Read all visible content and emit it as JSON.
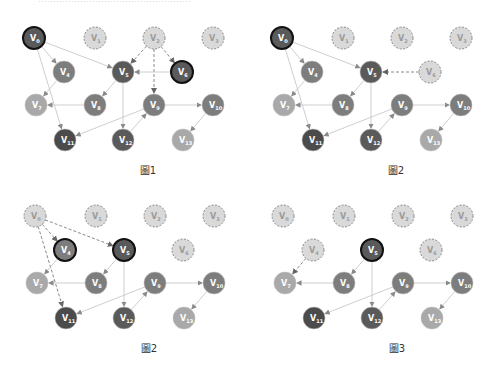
{
  "header": {
    "clipped_text": "……………………………………………"
  },
  "colors": {
    "dark": "#4b4b4b",
    "darker": "#5a5a5a",
    "medium": "#7d7d7d",
    "light": "#a9a9a9",
    "removed_fill": "#d9d9d9",
    "removed_stroke": "#8a8a8a",
    "edge": "#c8c8c8",
    "dashed_edge": "#8a8a8a",
    "highlight_stroke": "#111111"
  },
  "node_positions": {
    "V0": [
      34,
      38
    ],
    "V1": [
      95,
      38
    ],
    "V2": [
      154,
      38
    ],
    "V3": [
      213,
      38
    ],
    "V4": [
      64,
      72
    ],
    "V5": [
      123,
      72
    ],
    "V6": [
      182,
      72
    ],
    "V7": [
      36,
      105
    ],
    "V8": [
      95,
      105
    ],
    "V9": [
      154,
      105
    ],
    "V10": [
      213,
      105
    ],
    "V11": [
      65,
      140
    ],
    "V12": [
      123,
      140
    ],
    "V13": [
      183,
      140
    ]
  },
  "node_shades": {
    "V0": "darker",
    "V1": "light",
    "V2": "light",
    "V3": "light",
    "V4": "medium",
    "V5": "darker",
    "V6": "darker",
    "V7": "light",
    "V8": "medium",
    "V9": "medium",
    "V10": "medium",
    "V11": "dark",
    "V12": "darker",
    "V13": "light"
  },
  "panels": [
    {
      "id": "panel-1",
      "offset": [
        0,
        0
      ],
      "caption": "圖1",
      "caption_pos": [
        128,
        162
      ],
      "removed": [
        "V1",
        "V3",
        "V2"
      ],
      "highlighted": [
        "V0",
        "V6"
      ],
      "edges": [
        [
          "V0",
          "V4",
          "solid"
        ],
        [
          "V0",
          "V5",
          "solid"
        ],
        [
          "V0",
          "V11",
          "solid"
        ],
        [
          "V2",
          "V5",
          "dashed"
        ],
        [
          "V2",
          "V6",
          "dashed"
        ],
        [
          "V2",
          "V9",
          "dashed"
        ],
        [
          "V6",
          "V5",
          "solid"
        ],
        [
          "V4",
          "V7",
          "solid"
        ],
        [
          "V5",
          "V8",
          "solid"
        ],
        [
          "V5",
          "V12",
          "solid"
        ],
        [
          "V8",
          "V7",
          "solid"
        ],
        [
          "V9",
          "V11",
          "solid"
        ],
        [
          "V9",
          "V10",
          "solid"
        ],
        [
          "V12",
          "V9",
          "solid"
        ],
        [
          "V10",
          "V13",
          "solid"
        ]
      ]
    },
    {
      "id": "panel-2",
      "offset": [
        248,
        0
      ],
      "caption": "圖2",
      "caption_pos": [
        128,
        162
      ],
      "removed": [
        "V1",
        "V2",
        "V3",
        "V6"
      ],
      "highlighted": [
        "V0"
      ],
      "edges": [
        [
          "V0",
          "V4",
          "solid"
        ],
        [
          "V0",
          "V5",
          "solid"
        ],
        [
          "V0",
          "V11",
          "solid"
        ],
        [
          "V6",
          "V5",
          "dashed"
        ],
        [
          "V4",
          "V7",
          "solid"
        ],
        [
          "V5",
          "V8",
          "solid"
        ],
        [
          "V5",
          "V12",
          "solid"
        ],
        [
          "V8",
          "V7",
          "solid"
        ],
        [
          "V9",
          "V11",
          "solid"
        ],
        [
          "V9",
          "V10",
          "solid"
        ],
        [
          "V12",
          "V9",
          "solid"
        ],
        [
          "V10",
          "V13",
          "solid"
        ]
      ]
    },
    {
      "id": "panel-3",
      "offset": [
        1,
        178
      ],
      "caption": "圖2",
      "caption_pos": [
        128,
        162
      ],
      "removed": [
        "V0",
        "V1",
        "V2",
        "V3",
        "V6"
      ],
      "highlighted": [
        "V4",
        "V5"
      ],
      "edges": [
        [
          "V0",
          "V4",
          "dashed"
        ],
        [
          "V0",
          "V5",
          "dashed"
        ],
        [
          "V0",
          "V11",
          "dashed"
        ],
        [
          "V4",
          "V7",
          "solid"
        ],
        [
          "V5",
          "V8",
          "solid"
        ],
        [
          "V5",
          "V12",
          "solid"
        ],
        [
          "V8",
          "V7",
          "solid"
        ],
        [
          "V9",
          "V11",
          "solid"
        ],
        [
          "V9",
          "V10",
          "solid"
        ],
        [
          "V12",
          "V9",
          "solid"
        ],
        [
          "V10",
          "V13",
          "solid"
        ]
      ]
    },
    {
      "id": "panel-4",
      "offset": [
        249,
        178
      ],
      "caption": "圖3",
      "caption_pos": [
        128,
        162
      ],
      "removed": [
        "V0",
        "V1",
        "V2",
        "V3",
        "V4",
        "V6"
      ],
      "highlighted": [
        "V5"
      ],
      "edges": [
        [
          "V4",
          "V7",
          "dashed"
        ],
        [
          "V5",
          "V8",
          "solid"
        ],
        [
          "V5",
          "V12",
          "solid"
        ],
        [
          "V8",
          "V7",
          "solid"
        ],
        [
          "V9",
          "V11",
          "solid"
        ],
        [
          "V9",
          "V10",
          "solid"
        ],
        [
          "V12",
          "V9",
          "solid"
        ],
        [
          "V10",
          "V13",
          "solid"
        ]
      ]
    }
  ]
}
